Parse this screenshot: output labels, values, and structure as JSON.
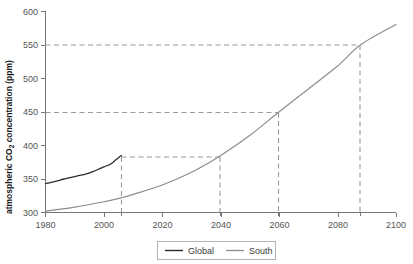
{
  "chart_data": {
    "type": "line",
    "title": "",
    "xlabel": "",
    "ylabel": "atmospheric CO2 concentration (ppm)",
    "ylabel_parts": {
      "before": "atmospheric CO",
      "sub": "2",
      "after": " concentration (ppm)"
    },
    "xlim": [
      1980,
      2100
    ],
    "ylim": [
      300,
      600
    ],
    "xticks": [
      1980,
      2000,
      2020,
      2040,
      2060,
      2080,
      2100
    ],
    "xticklabels": [
      "1980",
      "2000",
      "2020",
      "2040",
      "2060",
      "2080",
      "2100"
    ],
    "yticks": [
      300,
      350,
      400,
      450,
      500,
      550,
      600
    ],
    "yticklabels": [
      "300",
      "350",
      "400",
      "450",
      "500",
      "550",
      "600"
    ],
    "minor_xticks": [
      2006,
      2040,
      2060,
      2088
    ],
    "grid": false,
    "legend_position": "bottom-center",
    "series": [
      {
        "name": "Global",
        "color": "#2b2b2b",
        "x": [
          1980,
          1982,
          1984,
          1986,
          1988,
          1990,
          1992,
          1994,
          1996,
          1998,
          2000,
          2002,
          2004,
          2006
        ],
        "values": [
          343.0,
          345.0,
          347.0,
          349.5,
          351.5,
          353.5,
          355.5,
          357.5,
          360.5,
          364.0,
          368.0,
          371.5,
          378.0,
          385.0
        ]
      },
      {
        "name": "South",
        "color": "#8d8d8d",
        "x": [
          1980,
          1990,
          2000,
          2006,
          2010,
          2020,
          2030,
          2040,
          2050,
          2060,
          2070,
          2080,
          2088,
          2100
        ],
        "values": [
          302.0,
          308.0,
          316.0,
          322.0,
          327.0,
          341.0,
          360.0,
          385.0,
          415.0,
          450.0,
          484.0,
          518.0,
          550.0,
          580.0
        ]
      }
    ],
    "annotations": [
      {
        "name": "guide-global-2006",
        "type": "vertical-drop",
        "x": 2006,
        "y": 385,
        "label": "2006"
      },
      {
        "name": "guide-385-2040",
        "type": "horizontal-to-curve",
        "x": 2040,
        "y": 385,
        "label": "385 ppm at 2040"
      },
      {
        "name": "guide-450-2060",
        "type": "horizontal-to-curve",
        "x": 2060,
        "y": 450,
        "label": "450 ppm at 2060"
      },
      {
        "name": "guide-550-2088",
        "type": "horizontal-to-curve",
        "x": 2088,
        "y": 550,
        "label": "550 ppm at 2088"
      }
    ],
    "legend": [
      {
        "label": "Global",
        "color": "#2b2b2b"
      },
      {
        "label": "South",
        "color": "#8d8d8d"
      }
    ]
  },
  "axis": {
    "y_title_before": "atmospheric CO",
    "y_title_sub": "2",
    "y_title_after": " concentration (ppm)",
    "tick_600": "600",
    "tick_550": "550",
    "tick_500": "500",
    "tick_450": "450",
    "tick_400": "400",
    "tick_350": "350",
    "tick_300": "300",
    "tick_1980": "1980",
    "tick_2000": "2000",
    "tick_2020": "2020",
    "tick_2040": "2040",
    "tick_2060": "2060",
    "tick_2080": "2080",
    "tick_2100": "2100"
  },
  "legend": {
    "global_label": "Global",
    "south_label": "South"
  },
  "colors": {
    "global": "#2b2b2b",
    "south": "#8d8d8d",
    "axis": "#777777",
    "guide": "#9a9a9a",
    "text": "#555555"
  }
}
